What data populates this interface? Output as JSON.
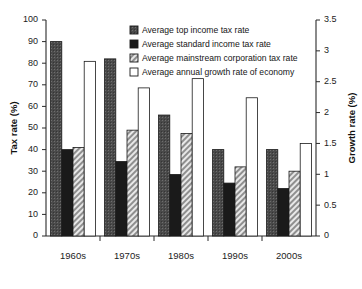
{
  "chart_data": {
    "type": "bar",
    "title": "",
    "subtitle": "",
    "categories": [
      "1960s",
      "1970s",
      "1980s",
      "1990s",
      "2000s"
    ],
    "xlabel": "",
    "ylabel": "Tax rate (%)",
    "ylabel_secondary": "Growth rate (%)",
    "ylim": [
      0,
      100
    ],
    "ylim_secondary": [
      0,
      3.5
    ],
    "yticks": [
      0,
      10,
      20,
      30,
      40,
      50,
      60,
      70,
      80,
      90,
      100
    ],
    "ytick_labels": [
      "0",
      "10",
      "20",
      "30",
      "40",
      "50",
      "60",
      "70",
      "80",
      "90",
      "100"
    ],
    "yticks_secondary": [
      0,
      0.5,
      1,
      1.5,
      2,
      2.5,
      3,
      3.5
    ],
    "ytick_labels_secondary": [
      "0",
      "0.5",
      "1",
      "1.5",
      "2",
      "2.5",
      "3",
      "3.5"
    ],
    "grid": false,
    "legend_position": "top-right",
    "series": [
      {
        "name": "Average top income tax rate",
        "axis": "left",
        "fill": "#4a4a4a",
        "pattern": "dark-dotted",
        "values": [
          90,
          82,
          56,
          40,
          40
        ]
      },
      {
        "name": "Average standard income tax rate",
        "axis": "left",
        "fill": "#1a1a1a",
        "pattern": "solid-black",
        "values": [
          40,
          34.5,
          28.5,
          24.5,
          22
        ]
      },
      {
        "name": "Average mainstream corporation tax rate",
        "axis": "left",
        "fill": "#c9c9c9",
        "pattern": "diagonal-hatch",
        "values": [
          41,
          49,
          47.5,
          32,
          30
        ]
      },
      {
        "name": "Average annual growth rate of economy",
        "axis": "right",
        "fill": "#ffffff",
        "pattern": "white-open",
        "values": [
          2.83,
          2.4,
          2.55,
          2.24,
          1.5
        ]
      }
    ]
  }
}
